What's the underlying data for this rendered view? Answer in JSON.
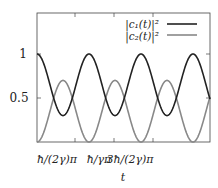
{
  "chart_data": {
    "type": "line",
    "title": "",
    "xlabel": "t",
    "ylabel": "",
    "xlim_px": [
      37,
      210
    ],
    "ylim": [
      0,
      1.47
    ],
    "xticks": [
      {
        "label": "ħ/(2γ)π",
        "value": 1
      },
      {
        "label": "ħ/γπ",
        "value": 2
      },
      {
        "label": "3ħ/(2γ)π",
        "value": 3
      }
    ],
    "yticks": [
      {
        "label": "0.5",
        "value": 0.5
      },
      {
        "label": "1",
        "value": 1
      }
    ],
    "grid": false,
    "legend_position": "upper right",
    "series": [
      {
        "name": "|c1(t)|²",
        "color": "#222222",
        "min": 0.3,
        "max": 1.0,
        "start": 1.0,
        "x_units": [
          0,
          0.67,
          1.33,
          2.0,
          2.67,
          3.33,
          4.0,
          4.44
        ],
        "values": [
          1.0,
          0.3,
          1.0,
          0.3,
          1.0,
          0.3,
          1.0,
          0.8
        ]
      },
      {
        "name": "|c2(t)|²",
        "color": "#888888",
        "min": 0.0,
        "max": 0.7,
        "start": 0.0,
        "x_units": [
          0,
          0.67,
          1.33,
          2.0,
          2.67,
          3.33,
          4.0,
          4.44
        ],
        "values": [
          0.0,
          0.7,
          0.0,
          0.7,
          0.0,
          0.7,
          0.0,
          0.2
        ]
      }
    ]
  },
  "legend": {
    "c1_label": "|c₁(t)|²",
    "c2_label": "|c₂(t)|²"
  },
  "axes": {
    "xlabel": "t",
    "xtick_labels": [
      "ħ/(2γ)π",
      "ħ/γπ",
      "3ħ/(2γ)π"
    ],
    "ytick_labels": [
      "1",
      "0.5"
    ]
  }
}
